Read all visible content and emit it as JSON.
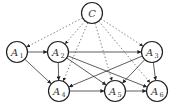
{
  "diagram": {
    "type": "directed-graph",
    "nodes": [
      {
        "id": "C",
        "label": "C",
        "sub": "",
        "x": 92,
        "y": 13
      },
      {
        "id": "A1",
        "label": "A",
        "sub": "1",
        "x": 17,
        "y": 52
      },
      {
        "id": "A2",
        "label": "A",
        "sub": "2",
        "x": 58,
        "y": 52
      },
      {
        "id": "A3",
        "label": "A",
        "sub": "3",
        "x": 152,
        "y": 52
      },
      {
        "id": "A4",
        "label": "A",
        "sub": "4",
        "x": 59,
        "y": 91
      },
      {
        "id": "A5",
        "label": "A",
        "sub": "5",
        "x": 115,
        "y": 91
      },
      {
        "id": "A6",
        "label": "A",
        "sub": "6",
        "x": 157,
        "y": 91
      }
    ],
    "edges_solid": [
      [
        "A1",
        "A2"
      ],
      [
        "A1",
        "A4"
      ],
      [
        "A2",
        "A3"
      ],
      [
        "A2",
        "A4"
      ],
      [
        "A2",
        "A5"
      ],
      [
        "A2",
        "A6"
      ],
      [
        "A3",
        "A4"
      ],
      [
        "A3",
        "A5"
      ],
      [
        "A3",
        "A6"
      ],
      [
        "A4",
        "A5"
      ],
      [
        "A5",
        "A6"
      ]
    ],
    "edges_dashed": [
      [
        "C",
        "A1"
      ],
      [
        "C",
        "A2"
      ],
      [
        "C",
        "A3"
      ],
      [
        "C",
        "A4"
      ],
      [
        "C",
        "A5"
      ],
      [
        "C",
        "A6"
      ]
    ],
    "node_radius": 10.5
  }
}
